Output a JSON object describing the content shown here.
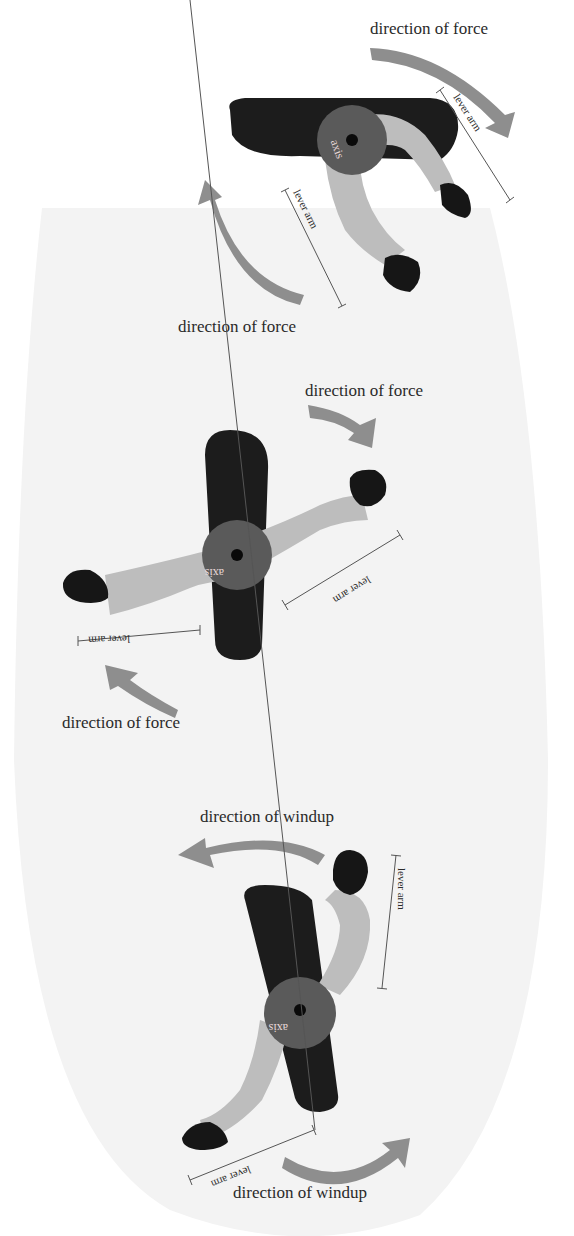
{
  "diagram": {
    "background": {
      "color": "#f3f3f3",
      "shape": "tall rounded capsule"
    },
    "panels": [
      {
        "id": "top",
        "labels": {
          "force_top": "direction of force",
          "force_bottom": "direction of force",
          "lever_right": "lever arm",
          "lever_left": "lever arm",
          "axis": "axis"
        }
      },
      {
        "id": "middle",
        "labels": {
          "force_top": "direction of force",
          "force_bottom": "direction of force",
          "lever_right": "lever arm",
          "lever_left": "lever arm",
          "axis": "axis"
        }
      },
      {
        "id": "bottom",
        "labels": {
          "windup_top": "direction of windup",
          "windup_bottom": "direction of windup",
          "lever_right": "lever arm",
          "lever_left": "lever arm",
          "axis": "axis"
        }
      }
    ],
    "colors": {
      "board": "#1c1c1c",
      "arm": "#bdbdbd",
      "hand": "#161616",
      "hub": "#5a5a5a",
      "arrow": "#8e8e8e",
      "text": "#2a2a2a"
    }
  }
}
